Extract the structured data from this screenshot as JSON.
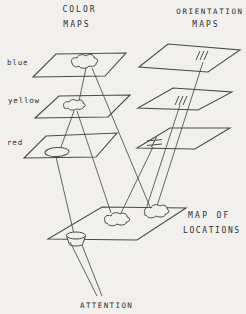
{
  "figure": {
    "color_maps": {
      "title_line1": "COLOR",
      "title_line2": "MAPS",
      "maps": [
        {
          "label": "blue"
        },
        {
          "label": "yellow"
        },
        {
          "label": "red"
        }
      ]
    },
    "orientation_maps": {
      "title_line1": "ORIENTATION",
      "title_line2": "MAPS"
    },
    "location_map": {
      "title_line1": "MAP OF",
      "title_line2": "LOCATIONS"
    },
    "attention": {
      "label": "ATTENTION"
    },
    "colors": {
      "paper_background": "#f1f0ed",
      "line_ink": "#4a4a4a",
      "text_ink": "#2f2f2f"
    }
  }
}
